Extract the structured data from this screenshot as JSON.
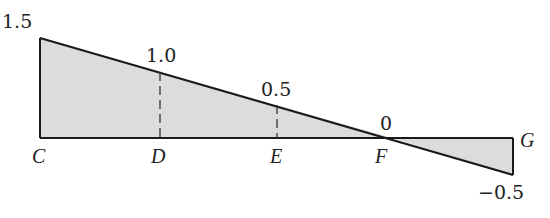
{
  "diagram": {
    "type": "influence-line",
    "colors": {
      "fill": "#dcdcdc",
      "stroke": "#1a1a1a"
    },
    "points": [
      {
        "name": "C",
        "label": "C"
      },
      {
        "name": "D",
        "label": "D"
      },
      {
        "name": "E",
        "label": "E"
      },
      {
        "name": "F",
        "label": "F"
      },
      {
        "name": "G",
        "label": "G"
      }
    ],
    "values": [
      {
        "at": "C",
        "label": "1.5"
      },
      {
        "at": "D",
        "label": "1.0"
      },
      {
        "at": "E",
        "label": "0.5"
      },
      {
        "at": "F",
        "label": "0"
      },
      {
        "at": "G",
        "label": "−0.5"
      }
    ]
  }
}
